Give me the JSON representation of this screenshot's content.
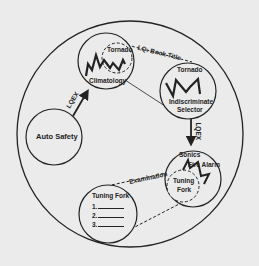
{
  "diagram": {
    "type": "concept-cycle",
    "colors": {
      "background": "#ebebeb",
      "ink": "#222222"
    },
    "nodes": {
      "auto_safety": {
        "label": "Auto Safety"
      },
      "climatology": {
        "label": "Climatology"
      },
      "tornado_inner": {
        "label": "Tornado"
      },
      "tornado_selector": {
        "title": "Tornado",
        "subtitle_line1": "Indiscriminate",
        "subtitle_line2": "Selector"
      },
      "sonics": {
        "label": "Sonics"
      },
      "fire_alarm": {
        "label": "Fire Alarm"
      },
      "tuning_fork_inner": {
        "line1": "Tuning",
        "line2": "Fork"
      },
      "tuning_fork_list": {
        "title": "Tuning Fork",
        "items": [
          "1.",
          "2.",
          "3."
        ]
      }
    },
    "edges": {
      "auto_to_climatology": {
        "label": "LQEX"
      },
      "tornado_link": {
        "label": "LQ: Book Title"
      },
      "selector_to_sonics": {
        "label": "LQEX"
      },
      "examination_link": {
        "label": "Examination"
      }
    },
    "icons": [
      "lightning-bolt-icon",
      "lightning-bolt-icon",
      "lightning-bolt-icon",
      "lightning-bolt-icon"
    ]
  }
}
